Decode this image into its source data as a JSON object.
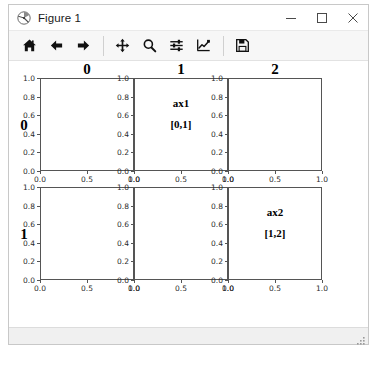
{
  "window": {
    "title": "Figure 1",
    "app_icon": "matplotlib-logo-icon",
    "controls": {
      "minimize": "minimize-icon",
      "maximize": "maximize-icon",
      "close": "close-icon"
    }
  },
  "toolbar": {
    "buttons": [
      {
        "name": "home-button",
        "icon": "home-icon",
        "tooltip": "Reset original view"
      },
      {
        "name": "back-button",
        "icon": "arrow-left-icon",
        "tooltip": "Back to previous view"
      },
      {
        "name": "forward-button",
        "icon": "arrow-right-icon",
        "tooltip": "Forward to next view"
      },
      {
        "name": "pan-button",
        "icon": "move-cross-icon",
        "tooltip": "Pan axes with left mouse, zoom with right"
      },
      {
        "name": "zoom-button",
        "icon": "magnifier-icon",
        "tooltip": "Zoom to rectangle"
      },
      {
        "name": "configure-subplots-button",
        "icon": "sliders-icon",
        "tooltip": "Configure subplots"
      },
      {
        "name": "edit-axis-button",
        "icon": "chart-line-icon",
        "tooltip": "Edit axis, curve and image parameters"
      },
      {
        "name": "save-button",
        "icon": "floppy-disk-icon",
        "tooltip": "Save the figure"
      }
    ],
    "separators_after": [
      2,
      6
    ]
  },
  "statusbar": {
    "message": "",
    "grip": "resize-grip-icon"
  },
  "chart_data": {
    "type": "table",
    "title": "",
    "layout": {
      "rows": 2,
      "cols": 3,
      "shared_axes": false,
      "grid": false,
      "legend": "none"
    },
    "col_titles": [
      "0",
      "1",
      "2"
    ],
    "row_titles": [
      "0",
      "1"
    ],
    "xlim": [
      0.0,
      1.0
    ],
    "ylim": [
      0.0,
      1.0
    ],
    "xticks": [
      "0.0",
      "0.5",
      "1.0"
    ],
    "yticks": [
      "0.0",
      "0.2",
      "0.4",
      "0.6",
      "0.8",
      "1.0"
    ],
    "xlabel": "",
    "ylabel": "",
    "subplots": [
      {
        "name": "axes-0-0",
        "row": 0,
        "col": 0,
        "label_line1": "",
        "label_line2": "",
        "series": []
      },
      {
        "name": "axes-0-1",
        "row": 0,
        "col": 1,
        "label_line1": "ax1",
        "label_line2": "[0,1]",
        "series": []
      },
      {
        "name": "axes-0-2",
        "row": 0,
        "col": 2,
        "label_line1": "",
        "label_line2": "",
        "series": []
      },
      {
        "name": "axes-1-0",
        "row": 1,
        "col": 0,
        "label_line1": "",
        "label_line2": "",
        "series": []
      },
      {
        "name": "axes-1-1",
        "row": 1,
        "col": 1,
        "label_line1": "",
        "label_line2": "",
        "series": []
      },
      {
        "name": "axes-1-2",
        "row": 1,
        "col": 2,
        "label_line1": "ax2",
        "label_line2": "[1,2]",
        "series": []
      }
    ]
  },
  "colors": {
    "figure_background": "#ffffff",
    "axes_edge": "#555555",
    "tick_label": "#2b2b2b",
    "toolbar_background": "#f7f7f7",
    "window_border": "#c8c8c8"
  }
}
